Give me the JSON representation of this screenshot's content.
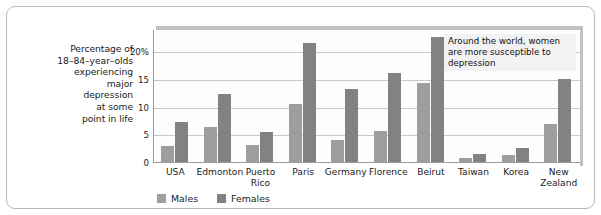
{
  "chart_data": {
    "type": "bar",
    "title": "",
    "xlabel": "",
    "ylabel_lines": [
      "Percentage of",
      "18–84–year–olds",
      "experiencing",
      "major",
      "depression",
      "at some",
      "point in life"
    ],
    "categories": [
      [
        "USA"
      ],
      [
        "Edmonton"
      ],
      [
        "Puerto",
        "Rico"
      ],
      [
        "Paris"
      ],
      [
        "Germany"
      ],
      [
        "Florence"
      ],
      [
        "Beirut"
      ],
      [
        "Taiwan"
      ],
      [
        "Korea"
      ],
      [
        "New",
        "Zealand"
      ]
    ],
    "series": [
      {
        "name": "Males",
        "color": "#9e9e9e",
        "values": [
          2.8,
          6.3,
          3.0,
          10.4,
          4.0,
          5.6,
          14.2,
          0.8,
          1.2,
          6.8
        ]
      },
      {
        "name": "Females",
        "color": "#828282",
        "values": [
          7.3,
          12.2,
          5.4,
          21.5,
          13.1,
          16.0,
          22.6,
          1.5,
          2.6,
          15.0
        ]
      }
    ],
    "ylim": [
      0,
      24
    ],
    "yticks": [
      0,
      5,
      10,
      15,
      20
    ],
    "ytick_labels": [
      "0",
      "5",
      "10",
      "15",
      "20%"
    ],
    "grid": true,
    "legend_position": "bottom-left",
    "annotation_lines": [
      "Around the world, women",
      "are more susceptible to",
      "depression"
    ]
  }
}
